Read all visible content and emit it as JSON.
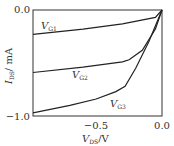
{
  "chart_data": {
    "type": "line",
    "title": "",
    "xlabel": "V_DS/V",
    "ylabel": "I_DS/ mA",
    "xlim": [
      -0.98,
      0.0
    ],
    "ylim": [
      -1.0,
      0.0
    ],
    "xticks": [
      "-0.5",
      "0.0"
    ],
    "xtick_values": [
      -0.5,
      0.0
    ],
    "yticks": [
      "0.0",
      "-1.0"
    ],
    "ytick_values": [
      0.0,
      -1.0
    ],
    "grid": false,
    "legend": "none (inline curve labels)",
    "series": [
      {
        "name": "V_G1",
        "x": [
          -0.98,
          -0.6,
          -0.3,
          -0.05,
          0.0
        ],
        "y": [
          -0.23,
          -0.18,
          -0.13,
          -0.07,
          0.0
        ]
      },
      {
        "name": "V_G2",
        "x": [
          -0.98,
          -0.6,
          -0.3,
          -0.25,
          -0.15,
          -0.05,
          0.0
        ],
        "y": [
          -0.59,
          -0.54,
          -0.49,
          -0.47,
          -0.38,
          -0.18,
          0.0
        ]
      },
      {
        "name": "V_G3",
        "x": [
          -0.98,
          -0.7,
          -0.5,
          -0.35,
          -0.28,
          -0.2,
          -0.1,
          0.0
        ],
        "y": [
          -0.97,
          -0.9,
          -0.84,
          -0.77,
          -0.72,
          -0.55,
          -0.3,
          0.0
        ]
      }
    ],
    "annotations": [
      "V_G1",
      "V_G2",
      "V_G3"
    ]
  },
  "labels": {
    "xlabel_main": "V",
    "xlabel_sub": "DS",
    "xlabel_unit": "/V",
    "ylabel_main": "I",
    "ylabel_sub": "DS",
    "ylabel_unit": "/ mA",
    "ytick_top": "0.0",
    "ytick_bottom": "−1.0",
    "xtick_mid": "−0.5",
    "xtick_right": "0.0",
    "g1_main": "V",
    "g1_sub": "G1",
    "g2_main": "V",
    "g2_sub": "G2",
    "g3_main": "V",
    "g3_sub": "G3"
  }
}
